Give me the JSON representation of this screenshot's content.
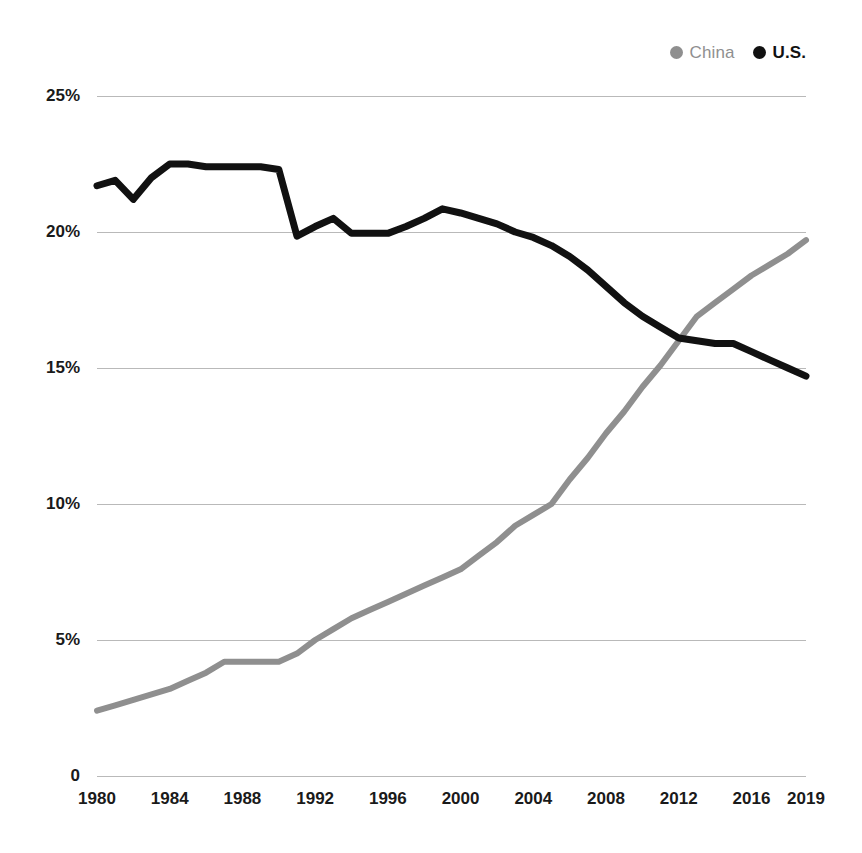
{
  "legend": {
    "position": "top-right",
    "entries": [
      {
        "label": "China",
        "color": "#8f8f8f",
        "marker": "circle-dot-icon"
      },
      {
        "label": "U.S.",
        "color": "#111111",
        "marker": "circle-dot-icon"
      }
    ]
  },
  "axes": {
    "y_ticks": [
      "25%",
      "20%",
      "15%",
      "10%",
      "5%",
      "0"
    ],
    "y_tick_values": [
      25,
      20,
      15,
      10,
      5,
      0
    ],
    "x_ticks": [
      "1980",
      "1984",
      "1988",
      "1992",
      "1996",
      "2000",
      "2004",
      "2008",
      "2012",
      "2016",
      "2019"
    ],
    "x_tick_values": [
      1980,
      1984,
      1988,
      1992,
      1996,
      2000,
      2004,
      2008,
      2012,
      2016,
      2019
    ]
  },
  "chart_data": {
    "type": "line",
    "title": "",
    "subtitle": "",
    "xlabel": "",
    "ylabel": "",
    "xlim": [
      1980,
      2019
    ],
    "ylim": [
      0,
      25
    ],
    "grid": "horizontal",
    "legend_position": "top-right",
    "x": [
      1980,
      1981,
      1982,
      1983,
      1984,
      1985,
      1986,
      1987,
      1988,
      1989,
      1990,
      1991,
      1992,
      1993,
      1994,
      1995,
      1996,
      1997,
      1998,
      1999,
      2000,
      2001,
      2002,
      2003,
      2004,
      2005,
      2006,
      2007,
      2008,
      2009,
      2010,
      2011,
      2012,
      2013,
      2014,
      2015,
      2016,
      2017,
      2018,
      2019
    ],
    "series": [
      {
        "name": "China",
        "color": "#8f8f8f",
        "values": [
          2.4,
          2.6,
          2.8,
          3.0,
          3.2,
          3.5,
          3.8,
          4.2,
          4.2,
          4.2,
          4.2,
          4.5,
          5.0,
          5.4,
          5.8,
          6.1,
          6.4,
          6.7,
          7.0,
          7.3,
          7.6,
          8.1,
          8.6,
          9.2,
          9.6,
          10.0,
          10.9,
          11.7,
          12.6,
          13.4,
          14.3,
          15.1,
          16.0,
          16.9,
          17.4,
          17.9,
          18.4,
          18.8,
          19.2,
          19.7
        ],
        "unit": "%"
      },
      {
        "name": "U.S.",
        "color": "#111111",
        "values": [
          21.7,
          21.9,
          21.2,
          22.0,
          22.5,
          22.5,
          22.4,
          22.4,
          22.4,
          22.4,
          22.3,
          19.85,
          20.2,
          20.5,
          19.95,
          19.95,
          19.95,
          20.2,
          20.5,
          20.85,
          20.7,
          20.5,
          20.3,
          20.0,
          19.8,
          19.5,
          19.1,
          18.6,
          18.0,
          17.4,
          16.9,
          16.5,
          16.1,
          16.0,
          15.9,
          15.9,
          15.6,
          15.3,
          15.0,
          14.7
        ],
        "unit": "%"
      }
    ]
  }
}
